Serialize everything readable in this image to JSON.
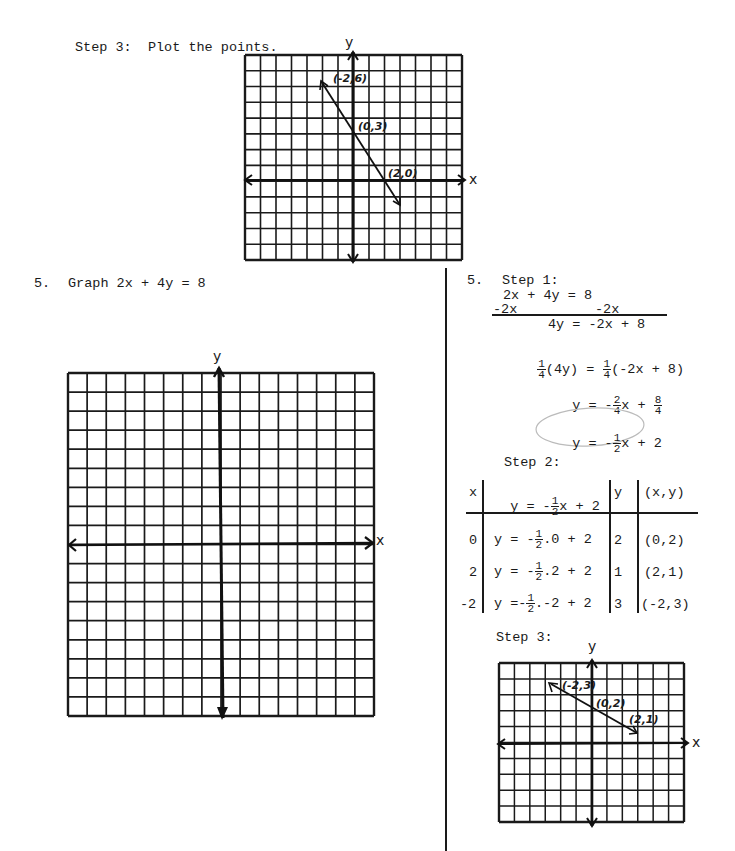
{
  "top_section": {
    "step_label": "Step 3:  Plot the points.",
    "graph": {
      "y_label": "y",
      "x_label": "x",
      "points": [
        {
          "label": "(-2,6)"
        },
        {
          "label": "(0,3)"
        },
        {
          "label": "(2,0)"
        }
      ]
    }
  },
  "problem": {
    "number": "5.",
    "prompt": "Graph 2x + 4y = 8",
    "graph": {
      "y_label": "y",
      "x_label": "x"
    }
  },
  "solution": {
    "number": "5.",
    "step1": {
      "label": "Step 1:",
      "line1": "2x + 4y = 8",
      "line2_left": "-2x",
      "line2_right": "-2x",
      "line3": "4y = -2x + 8",
      "line4_left": "(4y)",
      "line4_mid": " = ",
      "line4_right": "(-2x + 8)",
      "line5_left": "y = -",
      "line5_mid": "x + ",
      "line6_left": "y = -",
      "line6_right": "x + 2",
      "frac_one": "1",
      "frac_four": "4",
      "frac_two": "2",
      "frac_eight": "8"
    },
    "step2": {
      "label": "Step 2:",
      "headers": [
        "x",
        "y = -",
        "x + 2",
        "y",
        "(x,y)"
      ],
      "rows": [
        {
          "x": "0",
          "eq_left": "y = -",
          "eq_right": ".0 + 2",
          "y": "2",
          "pair": "(0,2)"
        },
        {
          "x": "2",
          "eq_left": "y = -",
          "eq_right": ".2 + 2",
          "y": "1",
          "pair": "(2,1)"
        },
        {
          "x": "-2",
          "eq_left": "y =-",
          "eq_right": ".-2 + 2",
          "y": "3",
          "pair": "(-2,3)"
        }
      ]
    },
    "step3": {
      "label": "Step 3:",
      "graph": {
        "y_label": "y",
        "x_label": "x",
        "points": [
          {
            "label": "(-2,3)"
          },
          {
            "label": "(0,2)"
          },
          {
            "label": "(2,1)"
          }
        ]
      }
    }
  },
  "chart_data": [
    {
      "type": "line",
      "title": "Step 3: Plot the points.",
      "xlabel": "x",
      "ylabel": "y",
      "grid": true,
      "x": [
        -2,
        0,
        2
      ],
      "series": [
        {
          "name": "y = -3/2 x + 3",
          "values": [
            6,
            3,
            0
          ]
        }
      ],
      "point_labels": [
        "(-2,6)",
        "(0,3)",
        "(2,0)"
      ]
    },
    {
      "type": "line",
      "title": "Graph 2x + 4y = 8",
      "xlabel": "x",
      "ylabel": "y",
      "grid": true,
      "x": [],
      "series": []
    },
    {
      "type": "line",
      "title": "Step 3",
      "xlabel": "x",
      "ylabel": "y",
      "grid": true,
      "x": [
        -2,
        0,
        2
      ],
      "series": [
        {
          "name": "y = -1/2 x + 2",
          "values": [
            3,
            2,
            1
          ]
        }
      ],
      "point_labels": [
        "(-2,3)",
        "(0,2)",
        "(2,1)"
      ]
    }
  ]
}
